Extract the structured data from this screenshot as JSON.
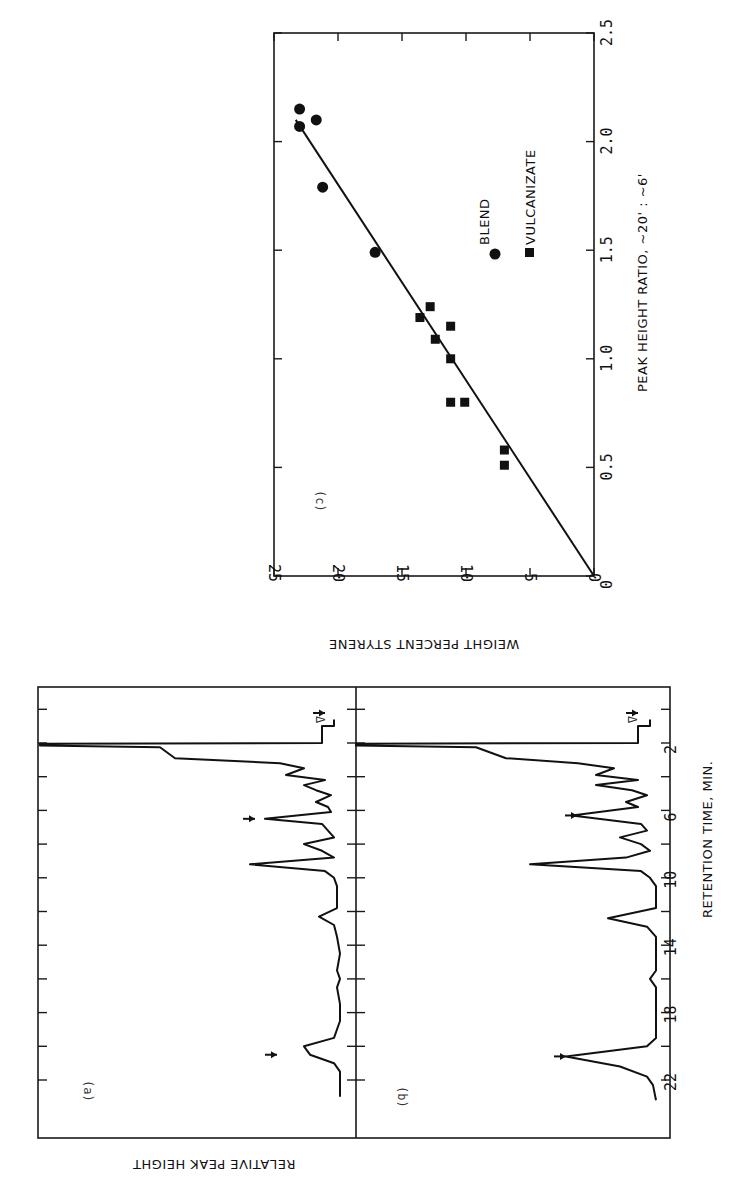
{
  "chart_data": [
    {
      "id": "c",
      "type": "scatter",
      "panel_label": "(c)",
      "title": "",
      "xlabel": "PEAK HEIGHT RATIO, ~20' : ~6'",
      "ylabel": "WEIGHT PERCENT STYRENE",
      "xlim": [
        0,
        2.5
      ],
      "ylim": [
        0,
        25
      ],
      "xticks": [
        "0",
        "0.5",
        "1.0",
        "1.5",
        "2.0",
        "2.5"
      ],
      "yticks": [
        "0",
        "5",
        "10",
        "15",
        "20",
        "25"
      ],
      "grid": false,
      "legend": {
        "position": "inside-right",
        "entries": [
          "BLEND",
          "VULCANIZATE"
        ]
      },
      "series": [
        {
          "name": "BLEND",
          "marker": "circle",
          "points": [
            [
              2.15,
              23.0
            ],
            [
              2.07,
              23.0
            ],
            [
              2.1,
              21.7
            ],
            [
              1.79,
              21.2
            ],
            [
              1.49,
              17.1
            ]
          ]
        },
        {
          "name": "VULCANIZATE",
          "marker": "square",
          "points": [
            [
              1.24,
              12.8
            ],
            [
              1.19,
              13.6
            ],
            [
              1.09,
              12.4
            ],
            [
              1.15,
              11.2
            ],
            [
              1.0,
              11.2
            ],
            [
              0.8,
              11.2
            ],
            [
              0.8,
              10.1
            ],
            [
              0.58,
              7.0
            ],
            [
              0.51,
              7.0
            ]
          ]
        }
      ],
      "fit_line": {
        "x": [
          0,
          2.1
        ],
        "y": [
          0,
          23.3
        ]
      }
    },
    {
      "id": "a",
      "type": "line",
      "panel_label": "(a)",
      "xlabel": "RETENTION TIME, MIN.",
      "ylabel": "RELATIVE PEAK HEIGHT",
      "xticks": [
        "2",
        "6",
        "10",
        "14",
        "18",
        "22"
      ],
      "xlim": [
        0.2,
        23.5
      ],
      "annotations": [
        "Δ",
        "arrow at ~6.5 min",
        "arrow at ~20.5 min"
      ],
      "series": [
        {
          "name": "chromatogram (a)",
          "x": [
            0.6,
            1.0,
            1.0,
            2.0,
            2.05,
            2.15,
            2.25,
            2.9,
            3.2,
            3.5,
            3.9,
            4.2,
            4.5,
            4.8,
            5.1,
            5.5,
            5.8,
            6.1,
            6.5,
            6.8,
            7.2,
            7.6,
            8.0,
            8.4,
            8.8,
            9.2,
            9.6,
            10.0,
            10.5,
            11.0,
            11.8,
            12.3,
            12.8,
            13.5,
            14.5,
            15.5,
            16.0,
            16.5,
            17.5,
            18.5,
            19.5,
            20.0,
            20.5,
            21.0,
            21.5,
            22.0,
            23.0
          ],
          "y": [
            0.02,
            0.02,
            0.06,
            0.06,
            1.0,
            1.0,
            0.6,
            0.55,
            0.2,
            0.12,
            0.18,
            0.05,
            0.12,
            0.08,
            0.03,
            0.08,
            0.04,
            0.03,
            0.25,
            0.06,
            0.04,
            0.02,
            0.12,
            0.06,
            0.02,
            0.3,
            0.05,
            0.02,
            0.01,
            0.01,
            0.01,
            0.07,
            0.02,
            0.01,
            0.0,
            0.01,
            0.0,
            0.01,
            0.0,
            0.0,
            0.02,
            0.12,
            0.1,
            0.02,
            0.0,
            0.0,
            0.0
          ]
        }
      ]
    },
    {
      "id": "b",
      "type": "line",
      "panel_label": "(b)",
      "xlabel": "RETENTION TIME, MIN.",
      "ylabel": "RELATIVE PEAK HEIGHT",
      "xticks": [
        "2",
        "6",
        "10",
        "14",
        "18",
        "22"
      ],
      "xlim": [
        0.2,
        23.5
      ],
      "annotations": [
        "Δ",
        "arrow at ~6.3 min",
        "arrow at ~20.6 min"
      ],
      "series": [
        {
          "name": "chromatogram (b)",
          "x": [
            0.6,
            1.0,
            1.0,
            2.0,
            2.05,
            2.15,
            2.25,
            2.9,
            3.2,
            3.5,
            3.9,
            4.2,
            4.5,
            4.8,
            5.1,
            5.5,
            5.8,
            6.3,
            6.8,
            7.2,
            7.6,
            8.0,
            8.4,
            8.8,
            9.2,
            9.6,
            10.0,
            10.5,
            11.0,
            11.8,
            12.4,
            12.9,
            13.5,
            14.5,
            15.5,
            16.0,
            16.5,
            17.5,
            18.5,
            19.5,
            20.0,
            20.6,
            21.2,
            21.8,
            22.3,
            23.2
          ],
          "y": [
            0.02,
            0.02,
            0.06,
            0.06,
            1.0,
            1.0,
            0.6,
            0.5,
            0.26,
            0.14,
            0.2,
            0.06,
            0.2,
            0.08,
            0.03,
            0.1,
            0.06,
            0.28,
            0.05,
            0.03,
            0.12,
            0.05,
            0.02,
            0.1,
            0.42,
            0.05,
            0.02,
            0.0,
            0.0,
            0.0,
            0.16,
            0.03,
            0.0,
            0.0,
            0.0,
            0.02,
            0.0,
            0.0,
            0.0,
            0.0,
            0.03,
            0.3,
            0.12,
            0.03,
            0.01,
            0.0
          ]
        }
      ]
    }
  ],
  "labels": {
    "c_panel": "(c)",
    "c_xlabel": "PEAK HEIGHT RATIO, ~20' : ~6'",
    "c_ylabel": "WEIGHT PERCENT STYRENE",
    "legend_blend": "BLEND",
    "legend_vulc": "VULCANIZATE",
    "ab_xlabel": "RETENTION TIME, MIN.",
    "ab_ylabel": "RELATIVE PEAK HEIGHT",
    "panel_a": "(a)",
    "panel_b": "(b)",
    "delta": "Δ"
  },
  "colors": {
    "ink": "#111111",
    "background": "#ffffff"
  }
}
